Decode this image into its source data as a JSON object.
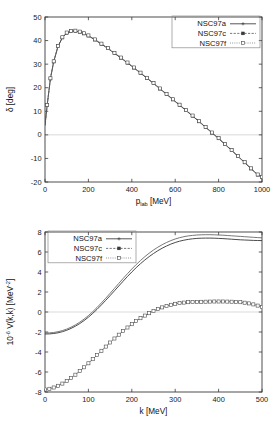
{
  "figure": {
    "background": "#ffffff",
    "panel_count": 2
  },
  "chart_data": [
    {
      "type": "line",
      "panel": "top",
      "title": "",
      "xlabel": "p_lab  [MeV]",
      "xlabel_base": "p",
      "xlabel_sub": "lab",
      "xlabel_unit": "[MeV]",
      "ylabel": "δ [deg]",
      "xlim": [
        0,
        1000
      ],
      "ylim": [
        -20,
        50
      ],
      "xticks": [
        0,
        200,
        400,
        600,
        800,
        1000
      ],
      "yticks": [
        -20,
        -10,
        0,
        10,
        20,
        30,
        40,
        50
      ],
      "grid": false,
      "zero_line": true,
      "legend_position": "top-right",
      "legend": [
        "NSC97a",
        "NSC97c",
        "NSC97f"
      ],
      "x": [
        0,
        10,
        25,
        40,
        60,
        80,
        100,
        120,
        140,
        160,
        180,
        200,
        230,
        260,
        290,
        320,
        350,
        380,
        410,
        440,
        470,
        500,
        530,
        560,
        590,
        620,
        650,
        680,
        710,
        740,
        770,
        800,
        830,
        860,
        890,
        920,
        950,
        980,
        1000
      ],
      "series": [
        {
          "name": "NSC97a",
          "marker": "plus",
          "linestyle": "solid",
          "values": [
            4.0,
            12.5,
            23.8,
            31.0,
            37.5,
            41.2,
            43.2,
            43.9,
            44.0,
            43.6,
            42.9,
            42.0,
            40.3,
            38.5,
            36.6,
            34.6,
            32.6,
            30.5,
            28.4,
            26.2,
            24.0,
            21.8,
            19.5,
            17.2,
            14.9,
            12.6,
            10.3,
            8.0,
            5.6,
            3.2,
            0.8,
            -1.6,
            -4.1,
            -6.6,
            -9.2,
            -11.8,
            -14.4,
            -17.0,
            -18.0
          ]
        },
        {
          "name": "NSC97c",
          "marker": "filled-square",
          "linestyle": "dashed",
          "values": [
            4.1,
            12.6,
            23.9,
            31.1,
            37.6,
            41.3,
            43.3,
            44.0,
            44.1,
            43.7,
            43.0,
            42.1,
            40.4,
            38.6,
            36.7,
            34.7,
            32.7,
            30.6,
            28.5,
            26.3,
            24.1,
            21.9,
            19.6,
            17.3,
            15.0,
            12.7,
            10.4,
            8.1,
            5.7,
            3.3,
            0.9,
            -1.5,
            -4.0,
            -6.5,
            -9.1,
            -11.7,
            -14.3,
            -16.9,
            -17.9
          ]
        },
        {
          "name": "NSC97f",
          "marker": "open-square",
          "linestyle": "dotted",
          "values": [
            4.2,
            12.7,
            24.0,
            31.2,
            37.7,
            41.4,
            43.4,
            44.1,
            44.2,
            43.8,
            43.1,
            42.2,
            40.5,
            38.7,
            36.8,
            34.8,
            32.8,
            30.7,
            28.6,
            26.4,
            24.2,
            22.0,
            19.7,
            17.4,
            15.1,
            12.8,
            10.5,
            8.2,
            5.8,
            3.4,
            1.0,
            -1.4,
            -3.9,
            -6.4,
            -9.0,
            -11.6,
            -14.2,
            -16.8,
            -17.8
          ]
        }
      ]
    },
    {
      "type": "line",
      "panel": "bottom",
      "title": "",
      "xlabel": "k [MeV]",
      "ylabel": "10^-6 V(k,k) [MeV^-2]",
      "ylabel_prefix": "10",
      "ylabel_exp": "-6",
      "ylabel_mid": " V(k,k) [MeV",
      "ylabel_exp2": "-2",
      "ylabel_suffix": "]",
      "xlim": [
        0,
        500
      ],
      "ylim": [
        -8,
        8
      ],
      "xticks": [
        0,
        100,
        200,
        300,
        400,
        500
      ],
      "yticks": [
        -8,
        -6,
        -4,
        -2,
        0,
        2,
        4,
        6,
        8
      ],
      "grid": false,
      "zero_line": true,
      "legend_position": "top-left",
      "legend": [
        "NSC97a",
        "NSC97c",
        "NSC97f"
      ],
      "x": [
        0,
        10,
        20,
        30,
        40,
        50,
        60,
        70,
        80,
        90,
        100,
        110,
        120,
        130,
        140,
        150,
        160,
        170,
        180,
        190,
        200,
        210,
        220,
        230,
        240,
        250,
        260,
        270,
        280,
        290,
        300,
        310,
        320,
        330,
        340,
        350,
        360,
        370,
        380,
        390,
        400,
        410,
        420,
        430,
        440,
        450,
        460,
        470,
        480,
        490,
        500
      ],
      "series": [
        {
          "name": "NSC97a",
          "marker": "plus",
          "linestyle": "solid",
          "group": "upper",
          "values": [
            -2.2,
            -2.19,
            -2.15,
            -2.08,
            -1.97,
            -1.83,
            -1.64,
            -1.42,
            -1.16,
            -0.86,
            -0.52,
            -0.14,
            0.27,
            0.71,
            1.17,
            1.64,
            2.12,
            2.6,
            3.08,
            3.55,
            4.0,
            4.43,
            4.83,
            5.2,
            5.54,
            5.85,
            6.13,
            6.38,
            6.6,
            6.79,
            6.95,
            7.08,
            7.18,
            7.26,
            7.32,
            7.36,
            7.38,
            7.39,
            7.39,
            7.38,
            7.36,
            7.34,
            7.31,
            7.28,
            7.25,
            7.22,
            7.2,
            7.18,
            7.16,
            7.15,
            7.14
          ]
        },
        {
          "name": "NSC97c",
          "marker": "filled-square",
          "linestyle": "dashed",
          "group": "upper",
          "values": [
            -2.1,
            -2.09,
            -2.05,
            -1.97,
            -1.86,
            -1.71,
            -1.52,
            -1.29,
            -1.02,
            -0.71,
            -0.36,
            0.03,
            0.46,
            0.91,
            1.38,
            1.87,
            2.36,
            2.86,
            3.35,
            3.83,
            4.3,
            4.74,
            5.15,
            5.53,
            5.88,
            6.2,
            6.48,
            6.73,
            6.95,
            7.14,
            7.3,
            7.43,
            7.53,
            7.61,
            7.66,
            7.7,
            7.72,
            7.73,
            7.73,
            7.72,
            7.7,
            7.68,
            7.65,
            7.62,
            7.59,
            7.56,
            7.53,
            7.5,
            7.47,
            7.44,
            7.42
          ]
        },
        {
          "name": "NSC97f",
          "marker": "open-square",
          "linestyle": "dotted",
          "group": "lower",
          "values": [
            -7.75,
            -7.68,
            -7.55,
            -7.38,
            -7.16,
            -6.9,
            -6.6,
            -6.27,
            -5.91,
            -5.53,
            -5.13,
            -4.72,
            -4.3,
            -3.88,
            -3.46,
            -3.05,
            -2.65,
            -2.27,
            -1.9,
            -1.55,
            -1.22,
            -0.91,
            -0.62,
            -0.36,
            -0.12,
            0.1,
            0.29,
            0.46,
            0.6,
            0.72,
            0.82,
            0.89,
            0.94,
            0.98,
            1.0,
            1.01,
            1.02,
            1.03,
            1.04,
            1.05,
            1.05,
            1.05,
            1.04,
            1.03,
            1.01,
            0.98,
            0.93,
            0.86,
            0.76,
            0.64,
            0.5
          ]
        }
      ]
    }
  ]
}
